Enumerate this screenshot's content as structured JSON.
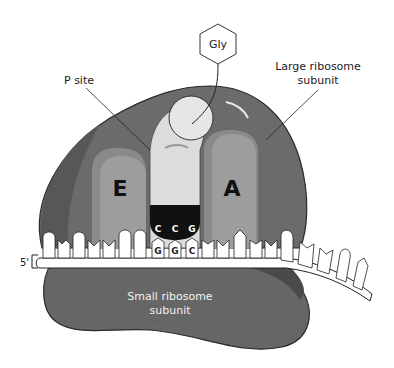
{
  "diagram": {
    "labels": {
      "amino_acid": "Gly",
      "p_site": "P site",
      "large_subunit_line1": "Large ribosome",
      "large_subunit_line2": "subunit",
      "small_subunit_line1": "Small ribosome",
      "small_subunit_line2": "subunit",
      "e_site": "E",
      "a_site": "A",
      "five_prime": "5'"
    },
    "anticodon": [
      "C",
      "C",
      "G"
    ],
    "codon": [
      "G",
      "G",
      "C"
    ],
    "colors": {
      "large_subunit": "#6b6b6b",
      "large_subunit_dark": "#575757",
      "site_pocket": "#8a8a8a",
      "site_inner": "#9d9d9d",
      "trna": "#dcdcdc",
      "small_subunit": "#666666",
      "mrna": "#ffffff",
      "anticodon_bg": "#111111",
      "outline": "#2a2a2a"
    }
  }
}
